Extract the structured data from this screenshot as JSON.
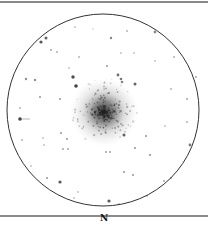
{
  "chart": {
    "type": "finder-chart",
    "orientation_label": "N",
    "colors": {
      "background": "#ffffff",
      "circle": "#333333",
      "rules": "#8a8a8a",
      "stars": "#222222"
    },
    "field_circle": {
      "cx": 103,
      "cy": 110,
      "r": 96
    },
    "cluster": {
      "cx": 104,
      "cy": 112,
      "core_r": 14,
      "halo_r": 34
    },
    "stars": [
      {
        "x": 41,
        "y": 42,
        "r": 1.6,
        "o": 0.75
      },
      {
        "x": 46,
        "y": 38,
        "r": 1.5,
        "o": 0.7
      },
      {
        "x": 51,
        "y": 50,
        "r": 1.0,
        "o": 0.4
      },
      {
        "x": 57,
        "y": 52,
        "r": 1.0,
        "o": 0.35
      },
      {
        "x": 75,
        "y": 27,
        "r": 0.9,
        "o": 0.3
      },
      {
        "x": 93,
        "y": 29,
        "r": 0.8,
        "o": 0.25
      },
      {
        "x": 111,
        "y": 38,
        "r": 1.2,
        "o": 0.55
      },
      {
        "x": 127,
        "y": 31,
        "r": 1.0,
        "o": 0.35
      },
      {
        "x": 155,
        "y": 32,
        "r": 1.4,
        "o": 0.55
      },
      {
        "x": 121,
        "y": 53,
        "r": 0.9,
        "o": 0.3
      },
      {
        "x": 134,
        "y": 53,
        "r": 0.9,
        "o": 0.3
      },
      {
        "x": 79,
        "y": 57,
        "r": 1.0,
        "o": 0.35
      },
      {
        "x": 155,
        "y": 61,
        "r": 0.9,
        "o": 0.3
      },
      {
        "x": 174,
        "y": 57,
        "r": 1.0,
        "o": 0.35
      },
      {
        "x": 107,
        "y": 66,
        "r": 1.1,
        "o": 0.45
      },
      {
        "x": 69,
        "y": 68,
        "r": 0.9,
        "o": 0.3
      },
      {
        "x": 73,
        "y": 77,
        "r": 1.7,
        "o": 0.8
      },
      {
        "x": 76,
        "y": 86,
        "r": 1.8,
        "o": 0.85
      },
      {
        "x": 118,
        "y": 75,
        "r": 1.4,
        "o": 0.65
      },
      {
        "x": 121,
        "y": 79,
        "r": 1.3,
        "o": 0.6
      },
      {
        "x": 122,
        "y": 82,
        "r": 1.3,
        "o": 0.55
      },
      {
        "x": 135,
        "y": 84,
        "r": 1.5,
        "o": 0.7
      },
      {
        "x": 26,
        "y": 79,
        "r": 1.2,
        "o": 0.5
      },
      {
        "x": 35,
        "y": 80,
        "r": 1.2,
        "o": 0.5
      },
      {
        "x": 40,
        "y": 97,
        "r": 1.1,
        "o": 0.45
      },
      {
        "x": 60,
        "y": 99,
        "r": 1.1,
        "o": 0.45
      },
      {
        "x": 20,
        "y": 108,
        "r": 1.0,
        "o": 0.35
      },
      {
        "x": 171,
        "y": 89,
        "r": 1.0,
        "o": 0.35
      },
      {
        "x": 196,
        "y": 77,
        "r": 1.0,
        "o": 0.4
      },
      {
        "x": 187,
        "y": 99,
        "r": 1.0,
        "o": 0.4
      },
      {
        "x": 20,
        "y": 119,
        "r": 1.8,
        "o": 0.85
      },
      {
        "x": 22,
        "y": 140,
        "r": 1.0,
        "o": 0.35
      },
      {
        "x": 43,
        "y": 138,
        "r": 0.9,
        "o": 0.3
      },
      {
        "x": 44,
        "y": 145,
        "r": 0.9,
        "o": 0.3
      },
      {
        "x": 61,
        "y": 133,
        "r": 1.1,
        "o": 0.45
      },
      {
        "x": 67,
        "y": 139,
        "r": 1.1,
        "o": 0.45
      },
      {
        "x": 63,
        "y": 149,
        "r": 1.0,
        "o": 0.4
      },
      {
        "x": 68,
        "y": 149,
        "r": 1.0,
        "o": 0.4
      },
      {
        "x": 31,
        "y": 166,
        "r": 0.9,
        "o": 0.3
      },
      {
        "x": 47,
        "y": 178,
        "r": 1.1,
        "o": 0.45
      },
      {
        "x": 60,
        "y": 182,
        "r": 1.6,
        "o": 0.75
      },
      {
        "x": 78,
        "y": 192,
        "r": 0.9,
        "o": 0.3
      },
      {
        "x": 74,
        "y": 198,
        "r": 0.9,
        "o": 0.3
      },
      {
        "x": 124,
        "y": 135,
        "r": 1.5,
        "o": 0.7
      },
      {
        "x": 146,
        "y": 136,
        "r": 1.1,
        "o": 0.45
      },
      {
        "x": 135,
        "y": 148,
        "r": 1.1,
        "o": 0.45
      },
      {
        "x": 150,
        "y": 155,
        "r": 1.1,
        "o": 0.5
      },
      {
        "x": 106,
        "y": 152,
        "r": 1.0,
        "o": 0.45
      },
      {
        "x": 110,
        "y": 152,
        "r": 1.0,
        "o": 0.45
      },
      {
        "x": 190,
        "y": 145,
        "r": 1.4,
        "o": 0.6
      },
      {
        "x": 187,
        "y": 122,
        "r": 1.0,
        "o": 0.35
      },
      {
        "x": 165,
        "y": 126,
        "r": 0.9,
        "o": 0.3
      },
      {
        "x": 124,
        "y": 172,
        "r": 1.1,
        "o": 0.45
      },
      {
        "x": 133,
        "y": 175,
        "r": 1.1,
        "o": 0.45
      },
      {
        "x": 164,
        "y": 181,
        "r": 1.0,
        "o": 0.4
      },
      {
        "x": 171,
        "y": 178,
        "r": 1.0,
        "o": 0.4
      },
      {
        "x": 109,
        "y": 201,
        "r": 1.6,
        "o": 0.75
      },
      {
        "x": 119,
        "y": 204,
        "r": 0.9,
        "o": 0.3
      },
      {
        "x": 147,
        "y": 196,
        "r": 0.9,
        "o": 0.3
      }
    ]
  }
}
